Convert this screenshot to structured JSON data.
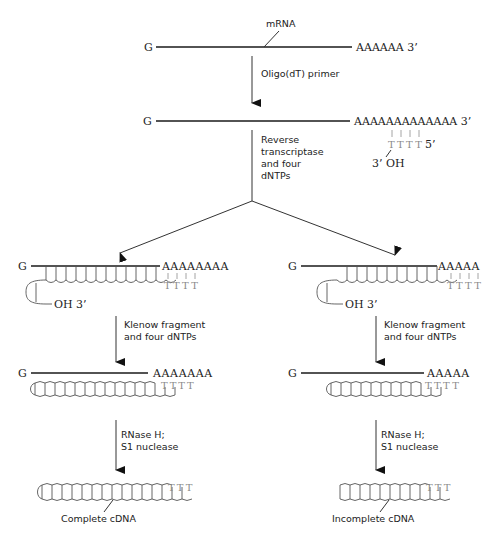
{
  "diagram": {
    "colors": {
      "strand": "#1a1a1a",
      "cdna": "#555555",
      "primer": "#8a8a8a",
      "background": "#ffffff"
    },
    "stage1": {
      "five_prime": "G",
      "label": "mRNA",
      "polyA": "AAAAAA  3’"
    },
    "step1": {
      "label": "Oligo(dT) primer"
    },
    "stage2": {
      "five_prime": "G",
      "polyA": "AAAAAAAAAAAAA  3’",
      "primer": "TTTT",
      "primer_end": "5’",
      "primer_oh": "3’  OH"
    },
    "step2": {
      "lines": [
        "Reverse",
        "transcriptase",
        "and four",
        "dNTPs"
      ]
    },
    "left": {
      "hybrid": {
        "five_prime": "G",
        "polyA": "AAAAAAAA",
        "oh": "OH  3’"
      },
      "step3": {
        "lines": [
          "Klenow fragment",
          "and four dNTPs"
        ]
      },
      "duplex": {
        "five_prime": "G",
        "polyA": "AAAAAAA"
      },
      "step4": {
        "lines": [
          "RNase H;",
          "S1 nuclease"
        ]
      },
      "result": "Complete cDNA"
    },
    "right": {
      "hybrid": {
        "five_prime": "G",
        "polyA": "AAAAA",
        "oh": "OH  3’"
      },
      "step3": {
        "lines": [
          "Klenow fragment",
          "and four dNTPs"
        ]
      },
      "duplex": {
        "five_prime": "G",
        "polyA": "AAAAA"
      },
      "step4": {
        "lines": [
          "RNase H;",
          "S1 nuclease"
        ]
      },
      "result": "Incomplete cDNA"
    }
  }
}
